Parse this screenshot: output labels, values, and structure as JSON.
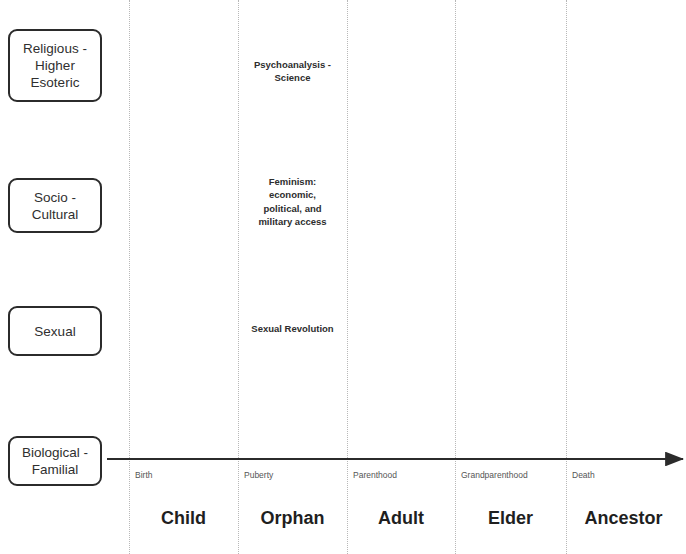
{
  "diagram": {
    "width": 686,
    "height": 554,
    "background_color": "#ffffff",
    "line_color": "#2b2b2b",
    "gridline_color": "#b8b8b8",
    "text_color": "#2f2f2f"
  },
  "domains": [
    {
      "label": "Religious -\nHigher\nEsoteric",
      "x": 8,
      "y": 29,
      "w": 94,
      "h": 73
    },
    {
      "label": "Socio -\nCultural",
      "x": 8,
      "y": 178,
      "w": 94,
      "h": 55
    },
    {
      "label": "Sexual",
      "x": 8,
      "y": 306,
      "w": 94,
      "h": 50
    },
    {
      "label": "Biological -\nFamilial",
      "x": 8,
      "y": 436,
      "w": 94,
      "h": 50
    }
  ],
  "gridlines": [
    {
      "name": "birth-gridline",
      "x": 129
    },
    {
      "name": "puberty-gridline",
      "x": 238
    },
    {
      "name": "parenthood-gridline",
      "x": 347
    },
    {
      "name": "grandparenthood-gridline",
      "x": 455
    },
    {
      "name": "death-gridline",
      "x": 566
    }
  ],
  "timeline": {
    "name": "biological-timeline-arrow",
    "x_start": 107,
    "x_end": 683,
    "y": 459,
    "color": "#2b2b2b"
  },
  "events": [
    {
      "label": "Birth",
      "x": 135,
      "y": 470
    },
    {
      "label": "Puberty",
      "x": 244,
      "y": 470
    },
    {
      "label": "Parenthood",
      "x": 353,
      "y": 470
    },
    {
      "label": "Grandparenthood",
      "x": 461,
      "y": 470
    },
    {
      "label": "Death",
      "x": 572,
      "y": 470
    }
  ],
  "stages": [
    {
      "label": "Child",
      "x": 129,
      "w": 109,
      "y": 508
    },
    {
      "label": "Orphan",
      "x": 238,
      "w": 109,
      "y": 508
    },
    {
      "label": "Adult",
      "x": 347,
      "w": 108,
      "y": 508
    },
    {
      "label": "Elder",
      "x": 455,
      "w": 111,
      "y": 508
    },
    {
      "label": "Ancestor",
      "x": 566,
      "w": 115,
      "y": 508
    }
  ],
  "annotations": [
    {
      "name": "psychoanalysis-science-annotation",
      "label": "Psychoanalysis -\nScience",
      "x": 238,
      "y": 58,
      "w": 109
    },
    {
      "name": "feminism-annotation",
      "label": "Feminism:\neconomic,\npolitical, and\nmilitary access",
      "x": 238,
      "y": 175,
      "w": 109
    },
    {
      "name": "sexual-revolution-annotation",
      "label": "Sexual Revolution",
      "x": 236,
      "y": 322,
      "w": 113
    }
  ]
}
